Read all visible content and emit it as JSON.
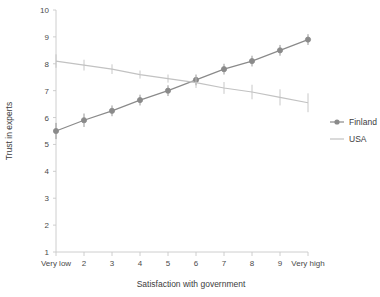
{
  "chart_data": {
    "type": "line",
    "title": "",
    "xlabel": "Satisfaction with government",
    "ylabel": "Trust in experts",
    "categories": [
      "Very low",
      "2",
      "3",
      "4",
      "5",
      "6",
      "7",
      "8",
      "9",
      "Very high"
    ],
    "x": [
      1,
      2,
      3,
      4,
      5,
      6,
      7,
      8,
      9,
      10
    ],
    "xlim": [
      1,
      10
    ],
    "ylim": [
      1,
      10
    ],
    "yticks": [
      1,
      2,
      3,
      4,
      5,
      6,
      7,
      8,
      9,
      10
    ],
    "grid": false,
    "legend_position": "right",
    "series": [
      {
        "name": "Finland",
        "color": "#8a8a8a",
        "marker": "circle",
        "values": [
          5.5,
          5.9,
          6.25,
          6.65,
          7.0,
          7.4,
          7.8,
          8.1,
          8.5,
          8.9
        ],
        "err_low": [
          5.2,
          5.65,
          6.05,
          6.45,
          6.8,
          7.2,
          7.6,
          7.9,
          8.3,
          8.7
        ],
        "err_high": [
          5.8,
          6.15,
          6.45,
          6.85,
          7.2,
          7.6,
          8.0,
          8.3,
          8.7,
          9.1
        ]
      },
      {
        "name": "USA",
        "color": "#c2c2c2",
        "marker": "none",
        "values": [
          8.1,
          7.95,
          7.8,
          7.6,
          7.45,
          7.3,
          7.1,
          6.95,
          6.75,
          6.55
        ],
        "err_low": [
          7.85,
          7.75,
          7.62,
          7.45,
          7.3,
          7.1,
          6.88,
          6.68,
          6.45,
          6.2
        ],
        "err_high": [
          8.35,
          8.15,
          7.98,
          7.75,
          7.6,
          7.5,
          7.32,
          7.22,
          7.05,
          6.9
        ]
      }
    ]
  },
  "legend": {
    "items": [
      {
        "label": "Finland"
      },
      {
        "label": "USA"
      }
    ]
  },
  "axes": {
    "x_title": "Satisfaction with government",
    "y_title": "Trust in experts"
  }
}
